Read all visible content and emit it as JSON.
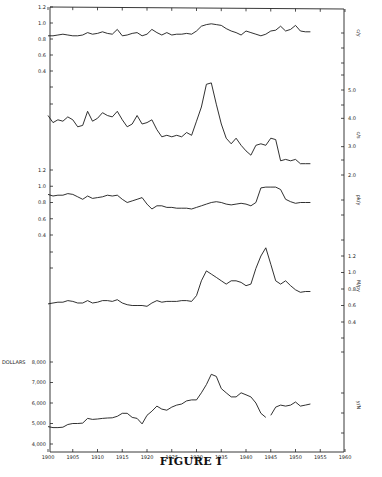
{
  "figure": {
    "caption": "FIGURE I"
  },
  "chart_data": [
    {
      "type": "line",
      "panel": 1,
      "series_label": "c/y",
      "axis_side": "left",
      "yticks": [
        "1.2",
        "1.0",
        "0.8",
        "0.6",
        "0.4"
      ],
      "ylim": [
        0.4,
        1.2
      ],
      "x": [
        1900,
        1901,
        1902,
        1903,
        1904,
        1905,
        1906,
        1907,
        1908,
        1909,
        1910,
        1911,
        1912,
        1913,
        1914,
        1915,
        1916,
        1917,
        1918,
        1919,
        1920,
        1921,
        1922,
        1923,
        1924,
        1925,
        1926,
        1927,
        1928,
        1929,
        1930,
        1931,
        1932,
        1933,
        1934,
        1935,
        1936,
        1937,
        1938,
        1939,
        1940,
        1941,
        1942,
        1943,
        1944,
        1945,
        1946,
        1947,
        1948,
        1949,
        1950,
        1951,
        1952,
        1953
      ],
      "values": [
        0.84,
        0.84,
        0.85,
        0.86,
        0.85,
        0.84,
        0.84,
        0.85,
        0.88,
        0.86,
        0.87,
        0.89,
        0.87,
        0.86,
        0.92,
        0.84,
        0.85,
        0.87,
        0.88,
        0.84,
        0.86,
        0.92,
        0.88,
        0.85,
        0.88,
        0.85,
        0.86,
        0.86,
        0.87,
        0.86,
        0.9,
        0.96,
        0.98,
        0.99,
        0.98,
        0.97,
        0.93,
        0.9,
        0.88,
        0.85,
        0.9,
        0.88,
        0.86,
        0.84,
        0.86,
        0.9,
        0.91,
        0.96,
        0.9,
        0.92,
        0.97,
        0.9,
        0.89,
        0.89
      ]
    },
    {
      "type": "line",
      "panel": 2,
      "series_label": "c/s",
      "axis_side": "right",
      "yticks": [
        "5.0",
        "4.0",
        "3.0",
        "2.0"
      ],
      "ylim": [
        2.0,
        5.0
      ],
      "x": [
        1900,
        1901,
        1902,
        1903,
        1904,
        1905,
        1906,
        1907,
        1908,
        1909,
        1910,
        1911,
        1912,
        1913,
        1914,
        1915,
        1916,
        1917,
        1918,
        1919,
        1920,
        1921,
        1922,
        1923,
        1924,
        1925,
        1926,
        1927,
        1928,
        1929,
        1930,
        1931,
        1932,
        1933,
        1934,
        1935,
        1936,
        1937,
        1938,
        1939,
        1940,
        1941,
        1942,
        1943,
        1944,
        1945,
        1946,
        1947,
        1948,
        1949,
        1950,
        1951,
        1952,
        1953
      ],
      "values": [
        4.1,
        3.85,
        3.95,
        3.9,
        4.05,
        3.95,
        3.7,
        3.75,
        4.25,
        3.9,
        4.0,
        4.2,
        4.1,
        4.05,
        4.25,
        3.95,
        3.7,
        3.8,
        4.1,
        3.8,
        3.85,
        3.95,
        3.6,
        3.35,
        3.4,
        3.35,
        3.4,
        3.35,
        3.5,
        3.4,
        3.9,
        4.4,
        5.2,
        5.25,
        4.5,
        3.8,
        3.3,
        3.1,
        3.3,
        3.05,
        2.85,
        2.7,
        3.05,
        3.1,
        3.05,
        3.3,
        3.25,
        2.5,
        2.55,
        2.5,
        2.55,
        2.4,
        2.4,
        2.4
      ]
    },
    {
      "type": "line",
      "panel": 3,
      "series_label": "pk/y",
      "axis_side": "left",
      "yticks": [
        "1.2",
        "1.0",
        "0.8",
        "0.6",
        "0.4"
      ],
      "ylim": [
        0.4,
        1.2
      ],
      "x": [
        1900,
        1901,
        1902,
        1903,
        1904,
        1905,
        1906,
        1907,
        1908,
        1909,
        1910,
        1911,
        1912,
        1913,
        1914,
        1915,
        1916,
        1917,
        1918,
        1919,
        1920,
        1921,
        1922,
        1923,
        1924,
        1925,
        1926,
        1927,
        1928,
        1929,
        1930,
        1931,
        1932,
        1933,
        1934,
        1935,
        1936,
        1937,
        1938,
        1939,
        1940,
        1941,
        1942,
        1943,
        1944,
        1945,
        1946,
        1947,
        1948,
        1949,
        1950,
        1951,
        1952,
        1953
      ],
      "values": [
        0.9,
        0.88,
        0.89,
        0.89,
        0.91,
        0.9,
        0.87,
        0.84,
        0.88,
        0.85,
        0.86,
        0.87,
        0.89,
        0.88,
        0.89,
        0.84,
        0.8,
        0.82,
        0.84,
        0.86,
        0.78,
        0.72,
        0.76,
        0.76,
        0.74,
        0.74,
        0.73,
        0.73,
        0.73,
        0.72,
        0.74,
        0.76,
        0.78,
        0.8,
        0.81,
        0.8,
        0.78,
        0.77,
        0.78,
        0.79,
        0.78,
        0.76,
        0.8,
        0.98,
        0.99,
        0.99,
        0.99,
        0.96,
        0.84,
        0.81,
        0.79,
        0.8,
        0.8,
        0.8
      ]
    },
    {
      "type": "line",
      "panel": 4,
      "series_label": "M/py",
      "axis_side": "right",
      "yticks": [
        "1.2",
        "1.0",
        "0.8",
        "0.6",
        "0.4"
      ],
      "ylim": [
        0.4,
        1.2
      ],
      "x": [
        1900,
        1901,
        1902,
        1903,
        1904,
        1905,
        1906,
        1907,
        1908,
        1909,
        1910,
        1911,
        1912,
        1913,
        1914,
        1915,
        1916,
        1917,
        1918,
        1919,
        1920,
        1921,
        1922,
        1923,
        1924,
        1925,
        1926,
        1927,
        1928,
        1929,
        1930,
        1931,
        1932,
        1933,
        1934,
        1935,
        1936,
        1937,
        1938,
        1939,
        1940,
        1941,
        1942,
        1943,
        1944,
        1945,
        1946,
        1947,
        1948,
        1949,
        1950,
        1951,
        1952,
        1953
      ],
      "values": [
        0.62,
        0.63,
        0.64,
        0.64,
        0.66,
        0.65,
        0.63,
        0.63,
        0.66,
        0.63,
        0.64,
        0.66,
        0.66,
        0.65,
        0.67,
        0.63,
        0.61,
        0.6,
        0.6,
        0.6,
        0.59,
        0.63,
        0.66,
        0.64,
        0.65,
        0.65,
        0.65,
        0.66,
        0.66,
        0.65,
        0.72,
        0.9,
        1.02,
        0.98,
        0.94,
        0.9,
        0.86,
        0.9,
        0.9,
        0.88,
        0.84,
        0.86,
        1.05,
        1.2,
        1.3,
        1.1,
        0.9,
        0.86,
        0.9,
        0.84,
        0.79,
        0.76,
        0.77,
        0.77
      ]
    },
    {
      "type": "line",
      "panel": 5,
      "series_label": "y/N",
      "axis_side": "left",
      "ylabel": "DOLLARS",
      "yticks": [
        "8,000",
        "7,000",
        "6,000",
        "5,000",
        "4,000"
      ],
      "ylim": [
        4000,
        8000
      ],
      "x": [
        1900,
        1901,
        1902,
        1903,
        1904,
        1905,
        1906,
        1907,
        1908,
        1909,
        1910,
        1911,
        1912,
        1913,
        1914,
        1915,
        1916,
        1917,
        1918,
        1919,
        1920,
        1921,
        1922,
        1923,
        1924,
        1925,
        1926,
        1927,
        1928,
        1929,
        1930,
        1931,
        1932,
        1933,
        1934,
        1935,
        1936,
        1937,
        1938,
        1939,
        1940,
        1941,
        1942,
        1943,
        1944,
        1945,
        1946,
        1947,
        1948,
        1949,
        1950,
        1951,
        1952,
        1953
      ],
      "values": [
        4850,
        4800,
        4800,
        4820,
        4950,
        5000,
        5000,
        5020,
        5250,
        5200,
        5220,
        5250,
        5270,
        5280,
        5350,
        5500,
        5500,
        5300,
        5250,
        4980,
        5400,
        5600,
        5850,
        5700,
        5650,
        5800,
        5900,
        5950,
        6100,
        6150,
        6150,
        6500,
        6900,
        7400,
        7300,
        6700,
        6500,
        6300,
        6300,
        6500,
        6400,
        6300,
        6000,
        5500,
        5300,
        5400,
        5800,
        5900,
        5850,
        5900,
        6050,
        5850,
        5900,
        5950
      ],
      "gap_after_year": 1944
    }
  ],
  "x_axis": {
    "ticks": [
      "1900",
      "1905",
      "1910",
      "1915",
      "1920",
      "1925",
      "1930",
      "1935",
      "1940",
      "1945",
      "1950",
      "1955",
      "1960"
    ],
    "xlim": [
      1900,
      1960
    ]
  }
}
